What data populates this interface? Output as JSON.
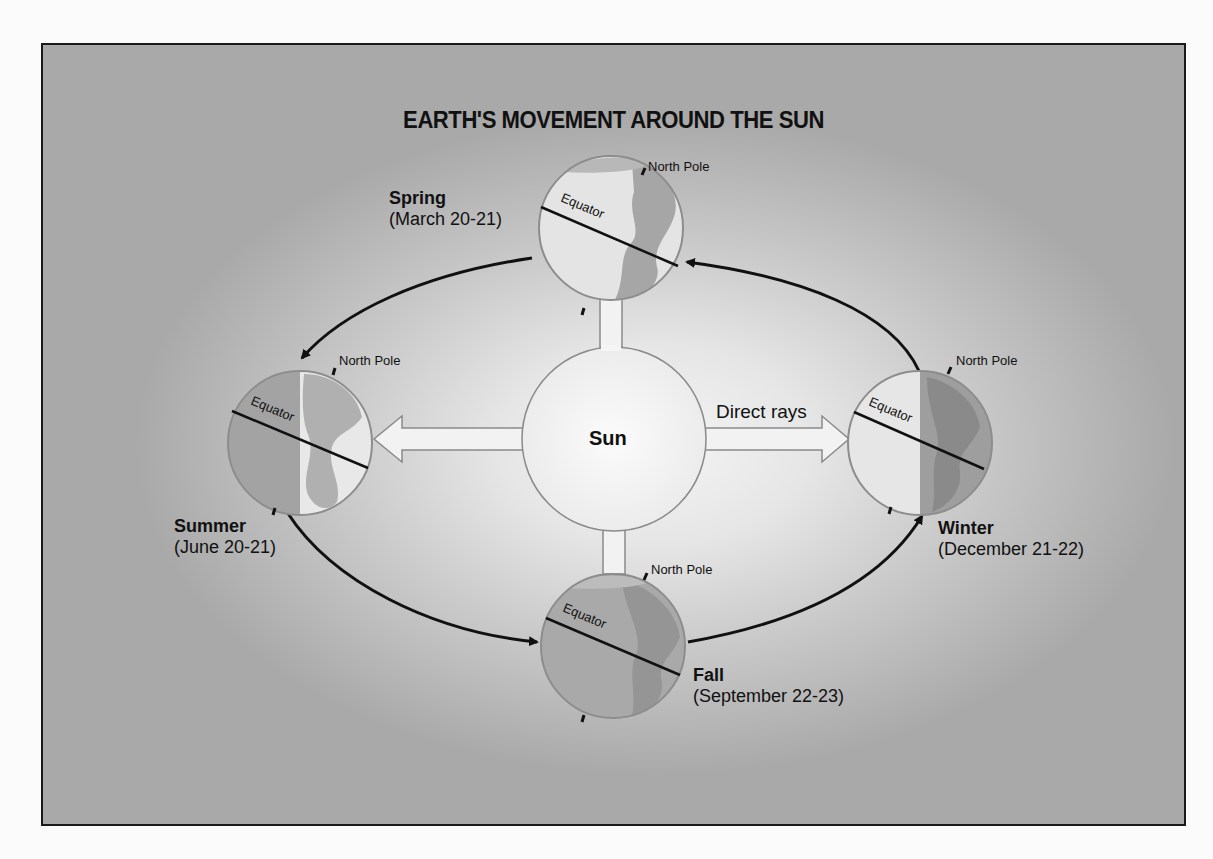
{
  "title": "EARTH'S MOVEMENT AROUND THE SUN",
  "sun": {
    "label": "Sun",
    "rays_label": "Direct rays"
  },
  "globes": {
    "spring": {
      "season": "Spring",
      "date": "(March 20-21)",
      "north_pole": "North Pole",
      "equator": "Equator"
    },
    "summer": {
      "season": "Summer",
      "date": "(June 20-21)",
      "north_pole": "North Pole",
      "equator": "Equator"
    },
    "winter": {
      "season": "Winter",
      "date": "(December 21-22)",
      "north_pole": "North Pole",
      "equator": "Equator"
    },
    "fall": {
      "season": "Fall",
      "date": "(September 22-23)",
      "north_pole": "North Pole",
      "equator": "Equator"
    }
  },
  "colors": {
    "background_center": "#f4f4f4",
    "background_edge": "#a9a9a9",
    "frame_border": "#1a1a1a",
    "text": "#111111",
    "globe_light": "#e2e2e2",
    "globe_dark": "#9c9c9c"
  }
}
